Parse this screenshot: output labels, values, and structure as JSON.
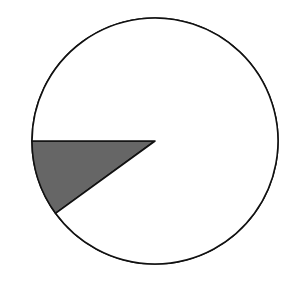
{
  "chart_data": {
    "type": "pie",
    "title": "",
    "slices": [
      {
        "label": "",
        "value": 10,
        "fill": "#666666",
        "start_angle_deg": 180,
        "direction": "counterclockwise-down"
      },
      {
        "label": "",
        "value": 90,
        "fill": "#ffffff"
      }
    ],
    "colors": {
      "outline": "#111111",
      "shaded": "#666666",
      "background": "#ffffff"
    }
  }
}
